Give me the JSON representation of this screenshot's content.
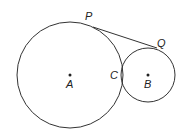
{
  "diagram": {
    "type": "geometry",
    "stroke_color": "#333333",
    "circles": [
      {
        "name": "circle-A",
        "center_label": "A",
        "cx": 70,
        "cy": 75,
        "r": 53
      },
      {
        "name": "circle-B",
        "center_label": "B",
        "cx": 148,
        "cy": 75,
        "r": 27
      }
    ],
    "points": [
      {
        "label": "P",
        "x": 93,
        "y": 27,
        "label_x": 85,
        "label_y": 20
      },
      {
        "label": "Q",
        "x": 157,
        "y": 48,
        "label_x": 157,
        "label_y": 47
      },
      {
        "label": "C",
        "x": 123,
        "y": 75,
        "label_x": 110,
        "label_y": 79
      },
      {
        "label": "A",
        "x": 70,
        "y": 75,
        "label_x": 66,
        "label_y": 88
      },
      {
        "label": "B",
        "x": 148,
        "y": 75,
        "label_x": 144,
        "label_y": 88
      }
    ],
    "segments": [
      {
        "from": "P",
        "to": "Q"
      }
    ]
  }
}
